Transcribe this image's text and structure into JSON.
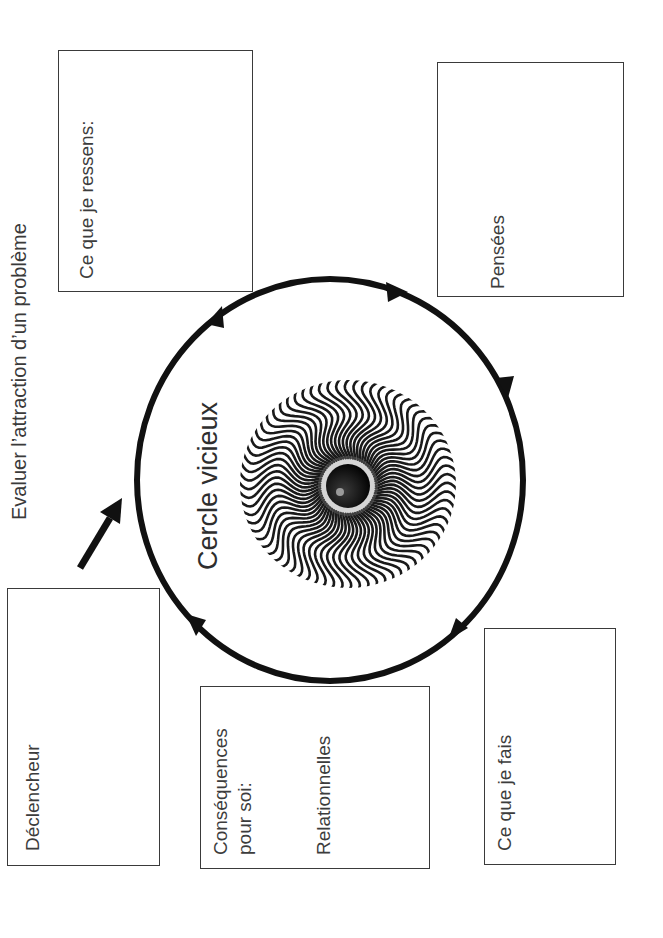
{
  "title": "Evaluer l’attraction d’un problème",
  "center": {
    "label": "Cercle vicieux",
    "image": "hypnotic-spiral-eye-icon"
  },
  "boxes": {
    "ressens": {
      "label": "Ce que je ressens:"
    },
    "pensees": {
      "label": "Pensées"
    },
    "declencheur": {
      "label": "Déclencheur"
    },
    "consequences": {
      "label_line1": "Conséquences",
      "label_line2": "pour soi:",
      "sublabel": "Relationnelles"
    },
    "fais": {
      "label": "Ce que je fais"
    }
  },
  "colors": {
    "stroke": "#111111",
    "box_border": "#3a3a3a",
    "text": "#3c3c3c",
    "background": "#ffffff"
  }
}
